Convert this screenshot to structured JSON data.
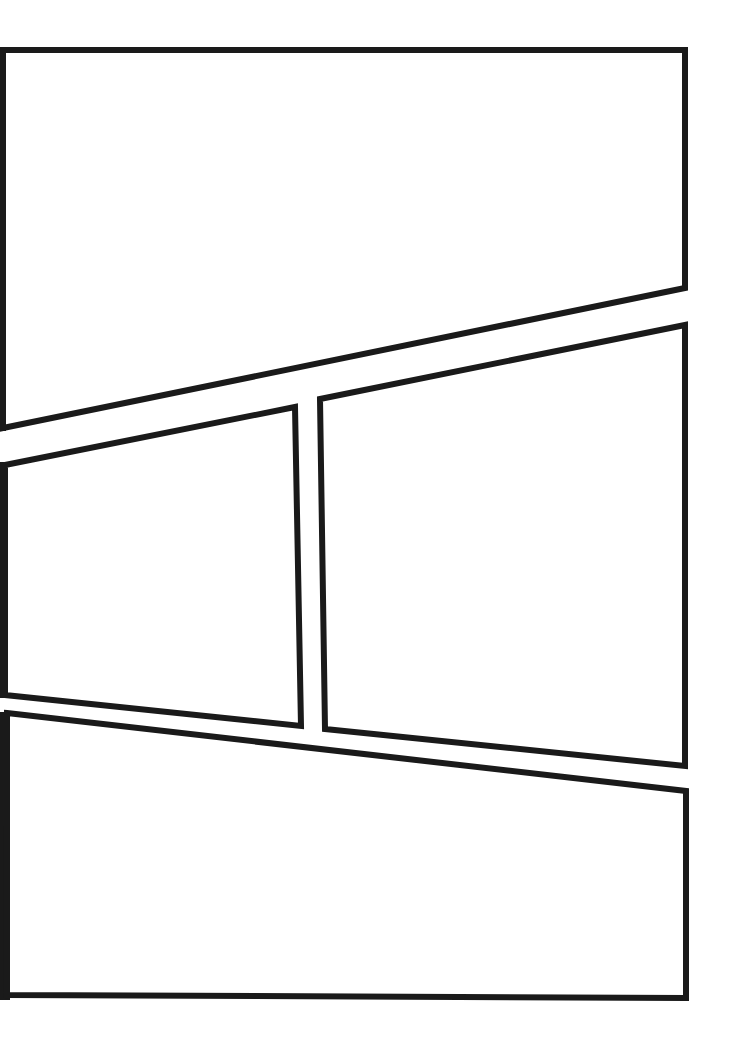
{
  "page": {
    "type": "comic-panel-template",
    "background_color": "#ffffff",
    "border_color": "#1a1a1a",
    "panel_count": 4
  },
  "panels": [
    {
      "id": "panel-1",
      "label": ""
    },
    {
      "id": "panel-2",
      "label": ""
    },
    {
      "id": "panel-3",
      "label": ""
    },
    {
      "id": "panel-4",
      "label": ""
    }
  ]
}
